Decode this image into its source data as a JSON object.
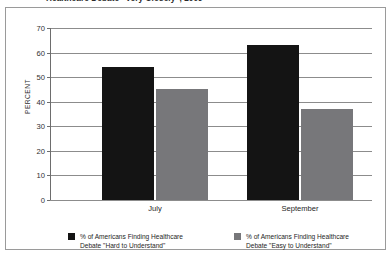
{
  "chart_data": {
    "type": "bar",
    "title": "Healthcare Debate \"Very Closely\", 2009",
    "xlabel": "",
    "ylabel": "PERCENT",
    "ylim": [
      0,
      70
    ],
    "yticks": [
      0,
      10,
      20,
      30,
      40,
      50,
      60,
      70
    ],
    "grid": true,
    "legend_position": "bottom",
    "categories": [
      "July",
      "September"
    ],
    "series": [
      {
        "name": "% of Americans Finding Healthcare Debate \"Hard to Understand\"",
        "name_line1": "% of Americans Finding Healthcare",
        "name_line2": "Debate \"Hard to Understand\"",
        "color": "#141414",
        "values": [
          54,
          63
        ]
      },
      {
        "name": "% of Americans Finding Healthcare Debate \"Easy to Understand\"",
        "name_line1": "% of Americans Finding Healthcare",
        "name_line2": "Debate \"Easy to Understand\"",
        "color": "#77777a",
        "values": [
          45,
          37
        ]
      }
    ]
  }
}
